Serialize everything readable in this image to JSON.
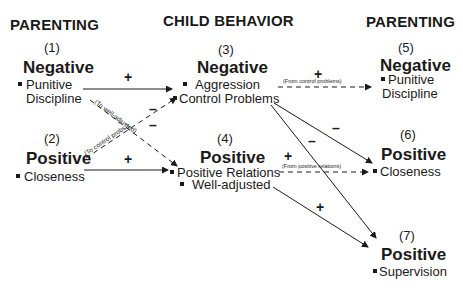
{
  "columns": {
    "left": "PARENTING",
    "middle": "CHILD BEHAVIOR",
    "right": "PARENTING"
  },
  "nodes": [
    {
      "id": "1",
      "label": "(1)",
      "category": "Negative",
      "items": [
        "Punitive",
        "Discipline"
      ]
    },
    {
      "id": "2",
      "label": "(2)",
      "category": "Positive",
      "items": [
        "Closeness"
      ]
    },
    {
      "id": "3",
      "label": "(3)",
      "category": "Negative",
      "items": [
        "Aggression",
        "Control Problems"
      ]
    },
    {
      "id": "4",
      "label": "(4)",
      "category": "Positive",
      "items": [
        "Positive Relations",
        "Well-adjusted"
      ]
    },
    {
      "id": "5",
      "label": "(5)",
      "category": "Negative",
      "items": [
        "Punitive",
        "Discipline"
      ]
    },
    {
      "id": "6",
      "label": "(6)",
      "category": "Positive",
      "items": [
        "Closeness"
      ]
    },
    {
      "id": "7",
      "label": "(7)",
      "category": "Positive",
      "items": [
        "Supervision"
      ]
    }
  ],
  "edges": [
    {
      "from": "Punitive Discipline (1)",
      "to": "Control Problems (3)",
      "sign": "+",
      "style": "solid"
    },
    {
      "from": "Punitive Discipline (1)",
      "to": "Positive Relations (4)",
      "sign": "-",
      "style": "dashed",
      "note": "(To well-adjusted)"
    },
    {
      "from": "Closeness (2)",
      "to": "Control Problems (3)",
      "sign": "-",
      "style": "dashed",
      "note": "(To control probs.)"
    },
    {
      "from": "Closeness (2)",
      "to": "Positive Relations (4)",
      "sign": "+",
      "style": "solid"
    },
    {
      "from": "Control Problems (3)",
      "to": "Punitive Discipline (5)",
      "sign": "+",
      "style": "dashed",
      "note": "(From control problems)"
    },
    {
      "from": "Control Problems (3)",
      "to": "Closeness (6)",
      "sign": "-",
      "style": "solid"
    },
    {
      "from": "Control Problems (3)",
      "to": "Supervision (7)",
      "sign": "-",
      "style": "solid"
    },
    {
      "from": "Positive Relations (4)",
      "to": "Closeness (6)",
      "sign": "+",
      "style": "dashed",
      "note": "(From positive relations)"
    },
    {
      "from": "Well-adjusted (4)",
      "to": "Supervision (7)",
      "sign": "+",
      "style": "solid"
    }
  ],
  "signs": {
    "plus": "+",
    "minus": "–"
  }
}
